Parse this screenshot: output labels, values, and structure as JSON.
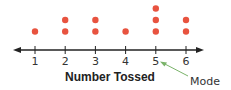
{
  "chart_data": {
    "type": "scatter",
    "subtype": "dot-plot",
    "title": "",
    "xlabel": "Number Tossed",
    "ylabel": "",
    "categories": [
      "1",
      "2",
      "3",
      "4",
      "5",
      "6"
    ],
    "values": [
      1,
      2,
      2,
      1,
      3,
      2
    ],
    "xlim": [
      1,
      6
    ],
    "grid": false,
    "legend": null,
    "annotations": [
      {
        "text": "Mode",
        "points_to": "5",
        "color": "#7ab36a"
      }
    ],
    "colors": {
      "dot": "#e8533f",
      "axis": "#222222",
      "arrow": "#7ab36a"
    }
  }
}
